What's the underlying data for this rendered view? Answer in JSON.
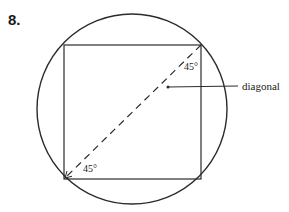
{
  "problem": {
    "number_label": "8."
  },
  "diagram": {
    "labels": {
      "angle_top_right": "45°",
      "angle_bottom_left": "45°",
      "diagonal": "diagonal"
    },
    "shapes": {
      "circle": {
        "cx": 132,
        "cy": 109,
        "r": 96
      },
      "square": {
        "x": 64,
        "y": 45,
        "width": 137,
        "height": 134
      },
      "diagonal_line": {
        "style": "dashed",
        "from": [
          201,
          45
        ],
        "to": [
          64,
          179
        ]
      }
    },
    "colors": {
      "stroke": "#2b2b2b",
      "text": "#1a1a1a",
      "background": "#ffffff"
    }
  }
}
